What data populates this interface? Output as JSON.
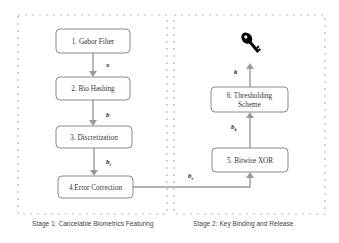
{
  "stages": [
    {
      "id": "stage1",
      "caption": "Stage 1: Cancelable Biometrics Featuring"
    },
    {
      "id": "stage2",
      "caption": "Stage 2: Key Binding and Release"
    }
  ],
  "nodes": {
    "gabor": {
      "label": "1. Gabor Filter"
    },
    "biohash": {
      "label": "2. Bio Hashing"
    },
    "discretization": {
      "label": "3. Discretization"
    },
    "error_correction": {
      "label": "4.Error Correction"
    },
    "xor": {
      "label": "5. Bitwise XOR"
    },
    "thresholding": {
      "line1": "6. Thresholding",
      "line2": "Scheme"
    }
  },
  "edges": {
    "gabor_to_biohash": {
      "label": "x",
      "sub": ""
    },
    "biohash_to_discretization": {
      "label": "b",
      "sub": ""
    },
    "discretization_to_ec": {
      "label": "b",
      "sub": "i"
    },
    "ec_to_xor": {
      "label": "b",
      "sub": "r"
    },
    "xor_to_thresholding": {
      "label": "b",
      "sub": "k"
    },
    "thresholding_to_key": {
      "label": "k",
      "sub": ""
    }
  },
  "icons": {
    "output": "key-icon"
  },
  "colors": {
    "edge": "#9a9a9a",
    "node_border": "#8a8a8a",
    "dashed_border": "#b8b8b8",
    "key": "#000000"
  }
}
